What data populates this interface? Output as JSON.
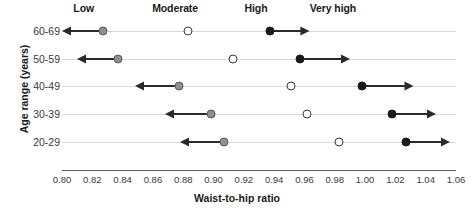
{
  "chart_data": {
    "type": "scatter",
    "title": "",
    "xlabel": "Waist-to-hip ratio",
    "ylabel": "Age range (years)",
    "xlim": [
      0.8,
      1.06
    ],
    "grid": true,
    "legend_position": "top",
    "x_ticks": [
      "0.80",
      "0.82",
      "0.84",
      "0.86",
      "0.88",
      "0.90",
      "0.92",
      "0.94",
      "0.96",
      "0.98",
      "1.00",
      "1.02",
      "1.04",
      "1.06"
    ],
    "x_tick_values": [
      0.8,
      0.82,
      0.84,
      0.86,
      0.88,
      0.9,
      0.92,
      0.94,
      0.96,
      0.98,
      1.0,
      1.02,
      1.04,
      1.06
    ],
    "categories": [
      "60-69",
      "50-59",
      "40-49",
      "30-39",
      "20-29"
    ],
    "risk_bands": [
      {
        "label": "Low",
        "header_x": 0.822
      },
      {
        "label": "Moderate",
        "header_x": 0.874
      },
      {
        "label": "High",
        "header_x": 0.935
      },
      {
        "label": "Very high",
        "header_x": 0.978
      }
    ],
    "series": [
      {
        "name": "Low",
        "marker": "gray-filled",
        "arrow": "left",
        "values": [
          0.827,
          0.837,
          0.877,
          0.898,
          0.907
        ]
      },
      {
        "name": "Moderate",
        "marker": "open",
        "arrow": "none",
        "values": [
          0.883,
          0.913,
          0.951,
          0.962,
          0.983
        ]
      },
      {
        "name": "Very high",
        "marker": "black-filled",
        "arrow": "right",
        "values": [
          0.937,
          0.957,
          0.998,
          1.018,
          1.027
        ]
      }
    ],
    "arrow_extents": {
      "left_end": [
        0.8,
        0.81,
        0.848,
        0.868,
        0.878
      ],
      "right_end": [
        0.963,
        0.99,
        1.032,
        1.047,
        1.056
      ]
    }
  }
}
